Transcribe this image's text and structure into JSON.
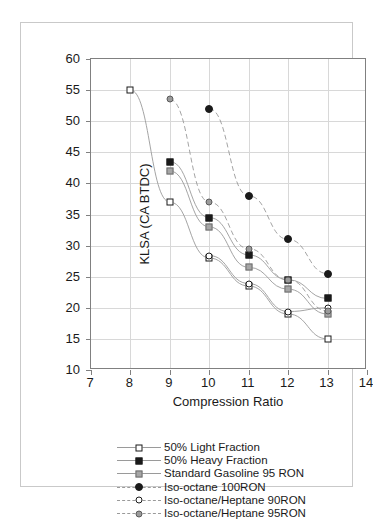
{
  "chart_data": {
    "type": "scatter",
    "title": "",
    "xlabel": "Compression Ratio",
    "ylabel": "KLSA (CA BTDC)",
    "xlim": [
      7,
      14
    ],
    "ylim": [
      10,
      60
    ],
    "xticks": [
      "7",
      "8",
      "9",
      "10",
      "11",
      "12",
      "13",
      "14"
    ],
    "yticks": [
      "10",
      "15",
      "20",
      "25",
      "30",
      "35",
      "40",
      "45",
      "50",
      "55",
      "60"
    ],
    "grid": true,
    "legend_position": "bottom",
    "series": [
      {
        "name": "50% Light Fraction",
        "marker": "open-square",
        "x": [
          8,
          9,
          10,
          11,
          12,
          13
        ],
        "y": [
          55,
          37,
          28,
          23.5,
          19,
          15
        ]
      },
      {
        "name": "50% Heavy Fraction",
        "marker": "filled-square",
        "x": [
          9,
          10,
          11,
          12,
          13
        ],
        "y": [
          43.5,
          34.5,
          28.5,
          24.5,
          21.5
        ]
      },
      {
        "name": "Standard Gasoline 95 RON",
        "marker": "gray-square",
        "x": [
          9,
          10,
          11,
          12,
          13
        ],
        "y": [
          42,
          33,
          26.5,
          23,
          19
        ]
      },
      {
        "name": "Iso-octane 100RON",
        "marker": "filled-circle",
        "x": [
          10,
          11,
          12,
          13
        ],
        "y": [
          52,
          38,
          31,
          25.5
        ]
      },
      {
        "name": "Iso-octane/Heptane 90RON",
        "marker": "open-circle",
        "x": [
          10,
          11,
          12,
          13
        ],
        "y": [
          28.4,
          23.9,
          19.4,
          20
        ]
      },
      {
        "name": "Iso-octane/Heptane 95RON",
        "marker": "gray-circle",
        "x": [
          9,
          10,
          11,
          12,
          13
        ],
        "y": [
          53.5,
          37,
          29.5,
          24.5,
          19.5
        ]
      }
    ]
  },
  "legend": {
    "entries": [
      {
        "label": "50% Light Fraction",
        "marker": "open-square"
      },
      {
        "label": "50% Heavy Fraction",
        "marker": "filled-square"
      },
      {
        "label": "Standard Gasoline 95 RON",
        "marker": "gray-square"
      },
      {
        "label": "Iso-octane 100RON",
        "marker": "filled-circle"
      },
      {
        "label": "Iso-octane/Heptane 90RON",
        "marker": "open-circle"
      },
      {
        "label": "Iso-octane/Heptane 95RON",
        "marker": "gray-circle"
      }
    ]
  },
  "colors": {
    "axis": "#808080",
    "grid": "#d8d8d8",
    "text": "#1a1a1a",
    "line": "#9a9a9a",
    "gray_marker": "#a6a6a6",
    "frame": "#c9c9c9"
  }
}
